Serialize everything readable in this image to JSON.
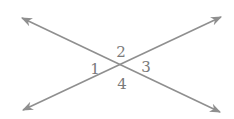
{
  "diagram": {
    "line_color": "#8f8f8f",
    "label_color": "#7a7a7a",
    "lines": [
      {
        "name": "line-a",
        "x1": 22,
        "y1": 18,
        "x2": 220,
        "y2": 112
      },
      {
        "name": "line-b",
        "x1": 23,
        "y1": 110,
        "x2": 221,
        "y2": 17
      }
    ],
    "intersection": {
      "x": 120,
      "y": 66
    },
    "angle_labels": [
      {
        "id": "1",
        "text": "1",
        "x": 95,
        "y": 74
      },
      {
        "id": "2",
        "text": "2",
        "x": 121,
        "y": 57
      },
      {
        "id": "3",
        "text": "3",
        "x": 146,
        "y": 72
      },
      {
        "id": "4",
        "text": "4",
        "x": 122,
        "y": 89
      }
    ]
  }
}
